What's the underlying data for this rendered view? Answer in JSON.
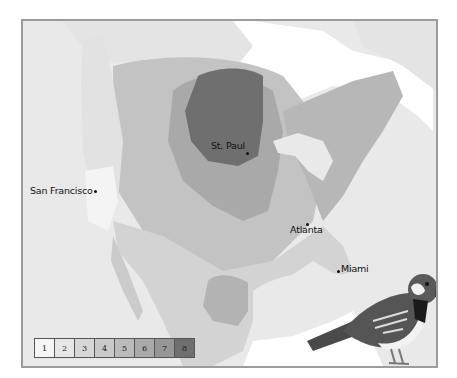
{
  "map": {
    "subject": "house-sparrow-range-density",
    "ocean_color": "#e9e9e9",
    "frame_border_color": "#9c9c9c"
  },
  "cities": [
    {
      "name": "St. Paul",
      "label_x": 188,
      "label_y": 119,
      "dot_x": 223,
      "dot_y": 131
    },
    {
      "name": "San Francisco",
      "label_x": 7,
      "label_y": 164,
      "dot_x": 71,
      "dot_y": 169
    },
    {
      "name": "Atlanta",
      "label_x": 267,
      "label_y": 203,
      "dot_x": 283,
      "dot_y": 202
    },
    {
      "name": "Miami",
      "label_x": 318,
      "label_y": 242,
      "dot_x": 314,
      "dot_y": 249
    }
  ],
  "legend": {
    "cells": [
      {
        "label": "1",
        "color": "#f5f5f5"
      },
      {
        "label": "2",
        "color": "#e6e6e6"
      },
      {
        "label": "3",
        "color": "#d7d7d7"
      },
      {
        "label": "4",
        "color": "#c9c9c9"
      },
      {
        "label": "5",
        "color": "#bbbbbb"
      },
      {
        "label": "6",
        "color": "#aaaaaa"
      },
      {
        "label": "7",
        "color": "#969696"
      },
      {
        "label": "8",
        "color": "#6f6f6f"
      }
    ]
  },
  "illustration": {
    "name": "house-sparrow"
  }
}
